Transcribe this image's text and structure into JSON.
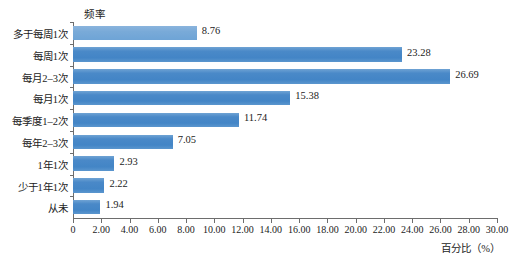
{
  "chart_data": {
    "type": "bar",
    "orientation": "horizontal",
    "title": "",
    "xlabel": "百分比（%）",
    "ylabel": "频率",
    "categories": [
      "多于每周1次",
      "每周1次",
      "每月2–3次",
      "每月1次",
      "每季度1–2次",
      "每年2–3次",
      "1年1次",
      "少于1年1次",
      "从未"
    ],
    "values": [
      8.76,
      23.28,
      26.69,
      15.38,
      11.74,
      7.05,
      2.93,
      2.22,
      1.94
    ],
    "value_labels": [
      "8.76",
      "23.28",
      "26.69",
      "15.38",
      "11.74",
      "7.05",
      "2.93",
      "2.22",
      "1.94"
    ],
    "xlim": [
      0,
      30
    ],
    "xtick_labels": [
      "0",
      "2.00",
      "4.00",
      "6.00",
      "8.00",
      "10.00",
      "12.00",
      "14.00",
      "16.00",
      "18.00",
      "20.00",
      "22.00",
      "24.00",
      "26.00",
      "28.00",
      "30.00"
    ],
    "xtick_values": [
      0,
      2,
      4,
      6,
      8,
      10,
      12,
      14,
      16,
      18,
      20,
      22,
      24,
      26,
      28,
      30
    ],
    "grid": false,
    "legend": false,
    "bar_color": "#4a89c8",
    "bar_color_light": "#7aabd9",
    "axis_color": "#6d6d6d",
    "text_color": "#1c1c1c",
    "background": "#ffffff"
  }
}
